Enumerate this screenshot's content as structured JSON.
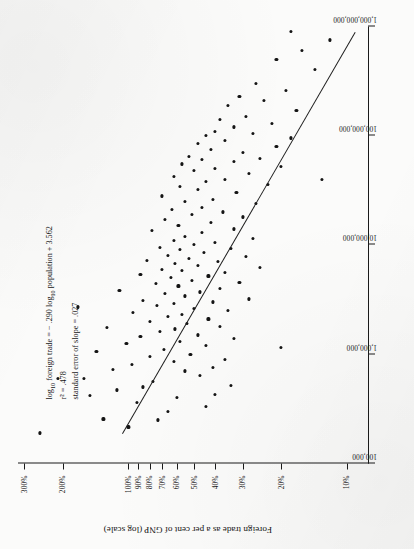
{
  "figure": {
    "orientation": "rotated-90-ccw",
    "ink_color": "#141414",
    "paper_color": "#fbfbfa"
  },
  "annotation": {
    "line1_pre": "log",
    "line1_sub1": "10",
    "line1_mid": " foreign trade = − .290 log",
    "line1_sub2": "10",
    "line1_post": " population + 3.562",
    "line2": "r² = .478",
    "line3": "standard error of slope = .027"
  },
  "axes": {
    "x": {
      "title": "Population (log scale)",
      "scale": "log",
      "ticks": [
        "100,000",
        "1,000,000",
        "10,000,000",
        "100,000,000",
        "1,000,000,000"
      ],
      "range": [
        100000,
        1000000000
      ]
    },
    "y": {
      "title": "Foreign trade as a per cent of GNP (log scale)",
      "scale": "log",
      "ticks": [
        "10%",
        "20%",
        "30%",
        "40%",
        "50%",
        "60%",
        "70%",
        "80%",
        "90%",
        "100%",
        "200%",
        "300%"
      ],
      "range": [
        8,
        320
      ]
    }
  },
  "chart_data": {
    "type": "scatter",
    "title": "",
    "xlabel": "Population (log scale)",
    "ylabel": "Foreign trade as a per cent of GNP (log scale)",
    "xscale": "log",
    "yscale": "log",
    "xlim": [
      100000,
      1000000000
    ],
    "ylim": [
      8,
      320
    ],
    "xticks": [
      100000,
      1000000,
      10000000,
      100000000,
      1000000000
    ],
    "xticklabels": [
      "100,000",
      "1,000,000",
      "10,000,000",
      "100,000,000",
      "1,000,000,000"
    ],
    "yticks": [
      10,
      20,
      30,
      40,
      50,
      60,
      70,
      80,
      90,
      100,
      200,
      300
    ],
    "yticklabels": [
      "10%",
      "20%",
      "30%",
      "40%",
      "50%",
      "60%",
      "70%",
      "80%",
      "90%",
      "100%",
      "200%",
      "300%"
    ],
    "grid": false,
    "legend": null,
    "annotations": [
      "log10 foreign trade = − .290 log10 population + 3.562",
      "r2 = .478",
      "standard error of slope = .027"
    ],
    "fit": {
      "type": "linear-in-log10",
      "slope": -0.29,
      "intercept": 3.562,
      "r_squared": 0.478,
      "standard_error_of_slope": 0.027
    },
    "marker": {
      "shape": "circle",
      "color": "#141414",
      "size": 3.2
    },
    "n_points": 134,
    "points": [
      [
        190000,
        255
      ],
      [
        215000,
        100
      ],
      [
        250000,
        73
      ],
      [
        255000,
        130
      ],
      [
        300000,
        66
      ],
      [
        330000,
        44
      ],
      [
        360000,
        91
      ],
      [
        400000,
        60
      ],
      [
        420000,
        150
      ],
      [
        430000,
        40
      ],
      [
        470000,
        113
      ],
      [
        500000,
        86
      ],
      [
        520000,
        34
      ],
      [
        560000,
        77
      ],
      [
        600000,
        160
      ],
      [
        640000,
        47
      ],
      [
        700000,
        55
      ],
      [
        720000,
        118
      ],
      [
        760000,
        41
      ],
      [
        800000,
        96
      ],
      [
        850000,
        62
      ],
      [
        900000,
        36
      ],
      [
        950000,
        80
      ],
      [
        1000000,
        52
      ],
      [
        1050000,
        140
      ],
      [
        1100000,
        69
      ],
      [
        1200000,
        44
      ],
      [
        1250000,
        102
      ],
      [
        1300000,
        58
      ],
      [
        1400000,
        33
      ],
      [
        1450000,
        88
      ],
      [
        1500000,
        48
      ],
      [
        1600000,
        72
      ],
      [
        1700000,
        61
      ],
      [
        1750000,
        125
      ],
      [
        1800000,
        38
      ],
      [
        1900000,
        54
      ],
      [
        2000000,
        80
      ],
      [
        2100000,
        43
      ],
      [
        2200000,
        66
      ],
      [
        2300000,
        57
      ],
      [
        2400000,
        95
      ],
      [
        2500000,
        35
      ],
      [
        2600000,
        50
      ],
      [
        2800000,
        74
      ],
      [
        2900000,
        62
      ],
      [
        3000000,
        41
      ],
      [
        3100000,
        86
      ],
      [
        3200000,
        28
      ],
      [
        3400000,
        55
      ],
      [
        3600000,
        68
      ],
      [
        3700000,
        47
      ],
      [
        3800000,
        110
      ],
      [
        4000000,
        38
      ],
      [
        4200000,
        59
      ],
      [
        4400000,
        75
      ],
      [
        4500000,
        31
      ],
      [
        4700000,
        51
      ],
      [
        5000000,
        64
      ],
      [
        5200000,
        43
      ],
      [
        5400000,
        88
      ],
      [
        5600000,
        36
      ],
      [
        5800000,
        57
      ],
      [
        6000000,
        70
      ],
      [
        6200000,
        25
      ],
      [
        6500000,
        48
      ],
      [
        6800000,
        61
      ],
      [
        7000000,
        39
      ],
      [
        7200000,
        82
      ],
      [
        7500000,
        53
      ],
      [
        7800000,
        29
      ],
      [
        8000000,
        66
      ],
      [
        8500000,
        45
      ],
      [
        9000000,
        58
      ],
      [
        9200000,
        34
      ],
      [
        9500000,
        72
      ],
      [
        10000000,
        50
      ],
      [
        10500000,
        40
      ],
      [
        11000000,
        62
      ],
      [
        11500000,
        27
      ],
      [
        12000000,
        55
      ],
      [
        13000000,
        46
      ],
      [
        13500000,
        78
      ],
      [
        14000000,
        33
      ],
      [
        15000000,
        59
      ],
      [
        16000000,
        42
      ],
      [
        17000000,
        68
      ],
      [
        18000000,
        30
      ],
      [
        19000000,
        51
      ],
      [
        20000000,
        37
      ],
      [
        21000000,
        63
      ],
      [
        22000000,
        46
      ],
      [
        24000000,
        26
      ],
      [
        25000000,
        55
      ],
      [
        26000000,
        41
      ],
      [
        28000000,
        70
      ],
      [
        30000000,
        32
      ],
      [
        32000000,
        48
      ],
      [
        34000000,
        58
      ],
      [
        36000000,
        23
      ],
      [
        38000000,
        44
      ],
      [
        40000000,
        36
      ],
      [
        42000000,
        62
      ],
      [
        45000000,
        28
      ],
      [
        48000000,
        50
      ],
      [
        50000000,
        40
      ],
      [
        52000000,
        20
      ],
      [
        55000000,
        57
      ],
      [
        58000000,
        33
      ],
      [
        60000000,
        46
      ],
      [
        62000000,
        25
      ],
      [
        65000000,
        53
      ],
      [
        70000000,
        30
      ],
      [
        75000000,
        42
      ],
      [
        80000000,
        21
      ],
      [
        85000000,
        48
      ],
      [
        90000000,
        36
      ],
      [
        95000000,
        18
      ],
      [
        100000000,
        44
      ],
      [
        105000000,
        27
      ],
      [
        110000000,
        40
      ],
      [
        120000000,
        33
      ],
      [
        130000000,
        22
      ],
      [
        140000000,
        38
      ],
      [
        150000000,
        29
      ],
      [
        170000000,
        17
      ],
      [
        190000000,
        35
      ],
      [
        210000000,
        24
      ],
      [
        230000000,
        31
      ],
      [
        260000000,
        19
      ],
      [
        300000000,
        26
      ],
      [
        400000000,
        14
      ],
      [
        500000000,
        21
      ],
      [
        600000000,
        16
      ],
      [
        750000000,
        12
      ],
      [
        900000000,
        18
      ],
      [
        600000,
        210
      ],
      [
        2700000,
        170
      ],
      [
        1150000,
        20
      ],
      [
        40000000,
        13
      ]
    ]
  }
}
